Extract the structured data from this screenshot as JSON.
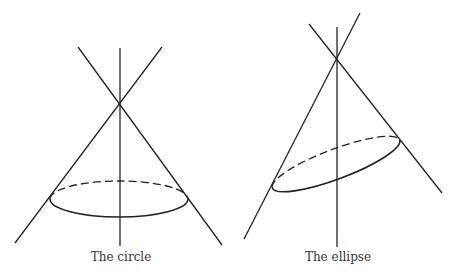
{
  "figures": [
    {
      "id": "circle",
      "caption": "The circle",
      "description": "Double cone cut by a plane perpendicular to the axis, producing a circle"
    },
    {
      "id": "ellipse",
      "caption": "The ellipse",
      "description": "Double cone cut by a tilted plane, producing an ellipse"
    }
  ],
  "colors": {
    "line": "#222222",
    "text": "#333333",
    "background": "#ffffff"
  }
}
